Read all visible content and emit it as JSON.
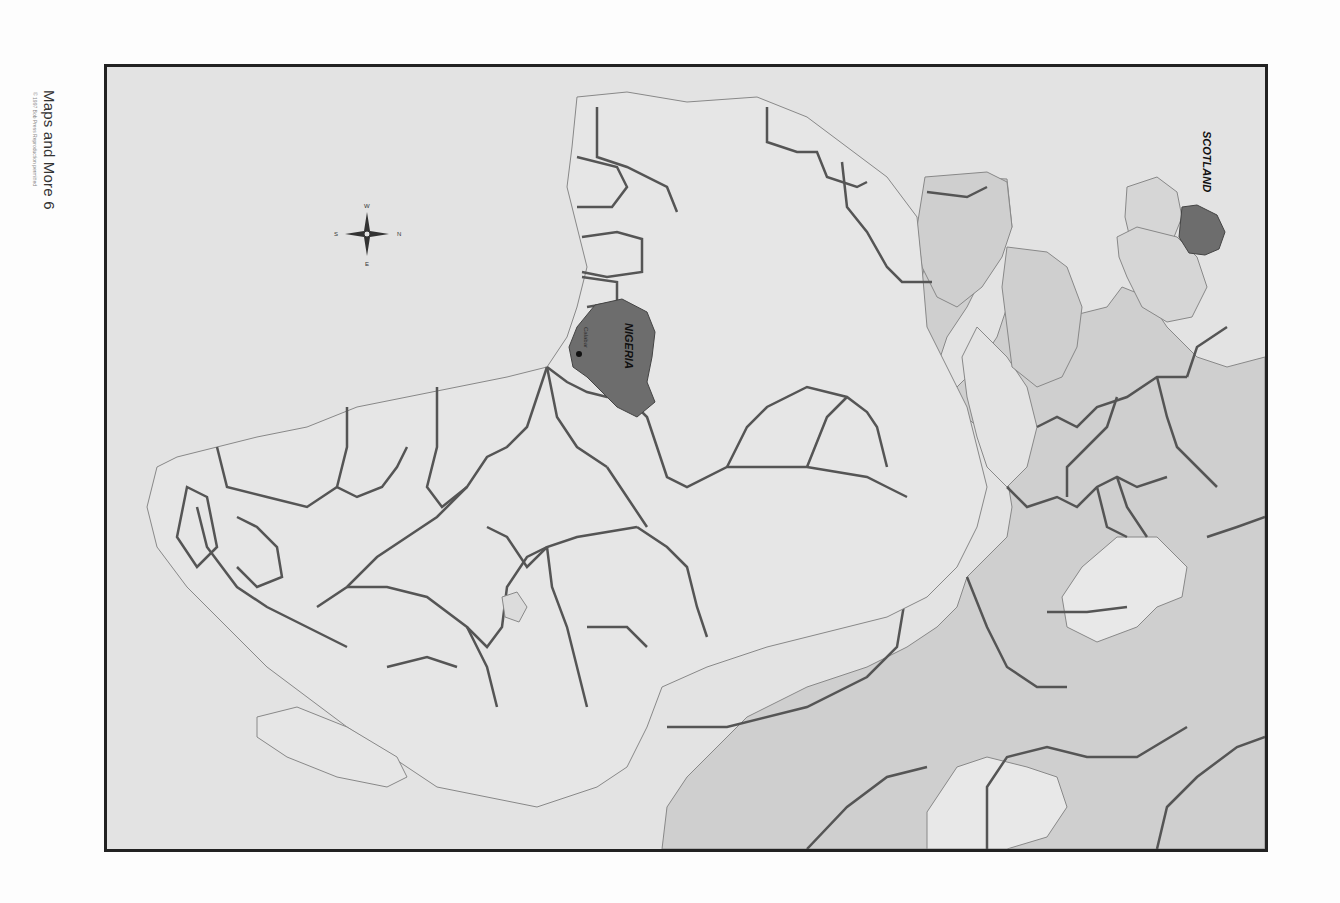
{
  "caption": {
    "title": "Maps and More 6",
    "credit": "© 1997 Bob Press Reproduction permitted"
  },
  "map": {
    "orientation": "rotated 90° clockwise (north points right)",
    "colors": {
      "sea": "#e3e3e3",
      "africa_land": "#e6e6e6",
      "europe_asia_land": "#cfcfcf",
      "highlight": "#6d6d6d",
      "border": "#555555",
      "frame": "#222222"
    },
    "highlighted_regions": [
      {
        "name": "NIGERIA",
        "label": "NIGERIA"
      },
      {
        "name": "SCOTLAND",
        "label": "SCOTLAND"
      }
    ],
    "cities": [
      {
        "name": "Calabar",
        "label": "Calabar"
      }
    ],
    "compass": {
      "n": "N",
      "s": "S",
      "e": "E",
      "w": "W"
    }
  }
}
